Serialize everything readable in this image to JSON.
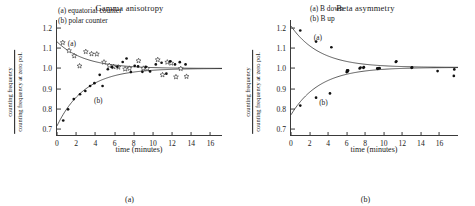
{
  "figure": {
    "panels": [
      {
        "id": "gamma",
        "title": "Gamma anisotropy",
        "subcaption": "(a)",
        "xlabel": "time (minutes)",
        "ylabel_numerator": "counting frequency",
        "ylabel_denominator": "counting frequency at zero pol.",
        "legend": [
          "(a) equatorial counter",
          "(b) polar counter"
        ],
        "curve_label_a": "(a)",
        "curve_label_b": "(b)"
      },
      {
        "id": "beta",
        "title": "Beta asymmetry",
        "subcaption": "(b)",
        "xlabel": "time (minutes)",
        "ylabel_numerator": "counting frequency",
        "ylabel_denominator": "counting frequency at zero pol.",
        "legend": [
          "(a) B down",
          "(b) B up"
        ],
        "curve_label_a": "(a)",
        "curve_label_b": "(b)"
      }
    ]
  },
  "chart_data": [
    {
      "type": "scatter",
      "id": "gamma-anisotropy",
      "title": "Gamma anisotropy",
      "subcaption": "(a)",
      "xlabel": "time (minutes)",
      "ylabel": "counting frequency / counting frequency at zero pol.",
      "xlim": [
        0,
        17.2
      ],
      "ylim": [
        0.67,
        1.24
      ],
      "xticks": [
        0,
        2,
        4,
        6,
        8,
        10,
        12,
        14,
        16
      ],
      "yticks": [
        0.7,
        0.8,
        0.9,
        1.0,
        1.1,
        1.2
      ],
      "grid": false,
      "legend_position": "top-center",
      "series": [
        {
          "name": "(a) equatorial counter",
          "marker": "open-star",
          "label_on_plot": "(a)",
          "label_xy": [
            1.55,
            1.128
          ],
          "points": [
            [
              0.6,
              1.128
            ],
            [
              1.25,
              1.088
            ],
            [
              1.8,
              1.062
            ],
            [
              2.35,
              1.012
            ],
            [
              3.0,
              1.083
            ],
            [
              3.6,
              1.072
            ],
            [
              4.15,
              1.071
            ],
            [
              4.9,
              1.031
            ],
            [
              5.45,
              1.014
            ],
            [
              5.9,
              1.008
            ],
            [
              6.4,
              1.006
            ],
            [
              7.1,
              0.997
            ],
            [
              7.55,
              1.0
            ],
            [
              8.5,
              1.038
            ],
            [
              9.0,
              1.0
            ],
            [
              9.4,
              0.999
            ],
            [
              10.5,
              1.043
            ],
            [
              11.0,
              0.968
            ],
            [
              11.5,
              1.031
            ],
            [
              11.9,
              1.026
            ],
            [
              12.4,
              0.958
            ],
            [
              12.9,
              0.999
            ],
            [
              13.5,
              0.96
            ]
          ],
          "fit_curve": "exponential decay from 1.13 to asymptote 1.00"
        },
        {
          "name": "(b) polar counter",
          "marker": "filled-circle",
          "label_on_plot": "(b)",
          "label_xy": [
            4.3,
            0.845
          ],
          "points": [
            [
              0.65,
              0.742
            ],
            [
              1.15,
              0.797
            ],
            [
              1.75,
              0.848
            ],
            [
              2.4,
              0.872
            ],
            [
              2.95,
              0.888
            ],
            [
              3.45,
              0.913
            ],
            [
              3.9,
              0.927
            ],
            [
              4.45,
              0.968
            ],
            [
              4.75,
              0.913
            ],
            [
              5.3,
              0.996
            ],
            [
              5.75,
              1.006
            ],
            [
              6.3,
              1.008
            ],
            [
              6.85,
              1.032
            ],
            [
              7.25,
              1.049
            ],
            [
              7.7,
              0.982
            ],
            [
              8.1,
              1.013
            ],
            [
              8.45,
              1.01
            ],
            [
              8.9,
              0.983
            ],
            [
              9.25,
              1.008
            ],
            [
              9.7,
              0.985
            ],
            [
              10.3,
              1.02
            ],
            [
              10.9,
              1.028
            ],
            [
              11.4,
              0.974
            ],
            [
              11.8,
              1.035
            ],
            [
              12.3,
              1.02
            ],
            [
              12.8,
              1.031
            ],
            [
              13.4,
              1.02
            ]
          ],
          "fit_curve": "exponential rise from 0.72 to asymptote 1.00"
        }
      ]
    },
    {
      "type": "scatter",
      "id": "beta-asymmetry",
      "title": "Beta asymmetry",
      "subcaption": "(b)",
      "xlabel": "time (minutes)",
      "ylabel": "counting frequency / counting frequency at zero pol.",
      "xlim": [
        0,
        18.0
      ],
      "ylim": [
        0.67,
        1.24
      ],
      "xticks": [
        0,
        2,
        4,
        6,
        8,
        10,
        12,
        14,
        16
      ],
      "yticks": [
        0.7,
        0.8,
        0.9,
        1.0,
        1.1,
        1.2
      ],
      "grid": false,
      "legend_position": "top-center",
      "series": [
        {
          "name": "(a) B down",
          "marker": "filled-circle",
          "label_on_plot": "(a)",
          "label_xy": [
            2.9,
            1.155
          ],
          "points": [
            [
              1.0,
              1.188
            ],
            [
              2.7,
              1.133
            ],
            [
              4.35,
              1.105
            ],
            [
              6.05,
              0.99
            ],
            [
              6.1,
              0.985
            ],
            [
              7.5,
              1.004
            ],
            [
              7.85,
              1.006
            ],
            [
              9.3,
              1.0
            ],
            [
              9.5,
              1.002
            ],
            [
              11.35,
              1.035
            ],
            [
              13.05,
              1.005
            ],
            [
              15.8,
              0.987
            ],
            [
              17.6,
              0.995
            ]
          ],
          "fit_curve": "exponential decay from 1.21 to asymptote 1.005"
        },
        {
          "name": "(b) B up",
          "marker": "filled-circle",
          "label_on_plot": "(b)",
          "label_xy": [
            3.5,
            0.833
          ],
          "points": [
            [
              1.0,
              0.816
            ],
            [
              2.7,
              0.855
            ],
            [
              4.2,
              0.876
            ],
            [
              6.0,
              0.982
            ],
            [
              6.15,
              0.99
            ],
            [
              7.4,
              1.0
            ],
            [
              7.8,
              1.003
            ],
            [
              9.35,
              0.998
            ],
            [
              9.55,
              1.001
            ],
            [
              11.3,
              1.032
            ],
            [
              13.0,
              1.003
            ],
            [
              17.55,
              0.963
            ]
          ],
          "fit_curve": "exponential rise from 0.77 to asymptote 1.005"
        }
      ]
    }
  ]
}
